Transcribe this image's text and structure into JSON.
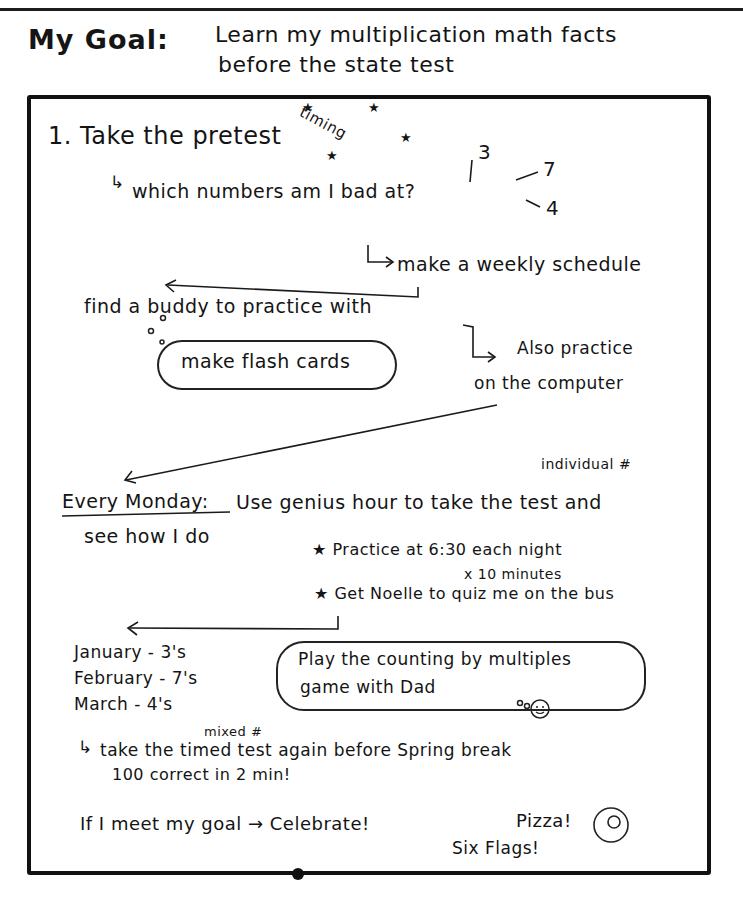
{
  "header": {
    "label": "My Goal:",
    "goal_line1": "Learn my multiplication math facts",
    "goal_line2": "before the state test"
  },
  "steps": {
    "step1": "1. Take the pretest",
    "timing_note": "timing",
    "stars": "★",
    "which_numbers": "which numbers am I bad at?",
    "bad_numbers": [
      "3",
      "7",
      "4"
    ],
    "weekly_schedule": "make a weekly schedule",
    "buddy": "find a buddy to practice with",
    "flash_cards": "make flash cards",
    "computer_line1": "Also practice",
    "computer_line2": "on the computer"
  },
  "monday": {
    "individual_note": "individual #",
    "label": "Every Monday:",
    "text_line1": "Use genius hour to take the test and",
    "text_line2": "see how I do",
    "bullet1": "★ Practice at 6:30 each night",
    "bullet1_sub": "x 10 minutes",
    "bullet2": "★ Get Noelle to quiz me on the bus"
  },
  "months": [
    {
      "label": "January - 3's"
    },
    {
      "label": "February - 7's"
    },
    {
      "label": "March - 4's"
    }
  ],
  "game_cloud": {
    "line1": "Play the counting by multiples",
    "line2": "game with Dad"
  },
  "retest": {
    "mixed_note": "mixed #",
    "line1": "take the timed test again before Spring break",
    "line2": "100 correct in 2 min!"
  },
  "celebrate": {
    "text": "If I meet my goal → Celebrate!",
    "pizza": "Pizza!",
    "six_flags": "Six Flags!",
    "spiral": "@"
  }
}
